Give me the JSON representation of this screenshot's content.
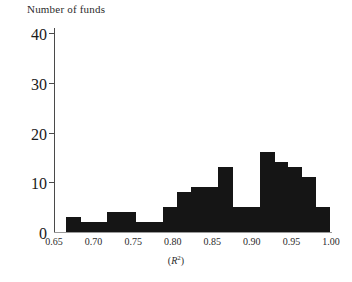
{
  "chart_data": {
    "type": "bar",
    "title": "Number of funds",
    "subtitle": "",
    "xlabel": "(R²)",
    "ylabel": "Number of funds",
    "orientation": "vertical",
    "grid": false,
    "legend": false,
    "legend_position": "none",
    "bar_color": "#151515",
    "axis_color": "#4a4a4a",
    "xlim": [
      0.64,
      1.005
    ],
    "ylim": [
      0,
      42
    ],
    "ytick_values": [
      0,
      10,
      20,
      30,
      40
    ],
    "ytick_labels": [
      "0",
      "10",
      "20",
      "30",
      "40"
    ],
    "xtick_values": [
      0.65,
      0.7,
      0.75,
      0.8,
      0.85,
      0.9,
      0.95,
      1.0
    ],
    "xtick_labels": [
      "0.65",
      "0.70",
      "0.75",
      "0.80",
      "0.85",
      "0.90",
      "0.95",
      "1.00"
    ],
    "bin_width": 0.0175,
    "bin_edges": [
      0.6475,
      0.665,
      0.6825,
      0.7,
      0.7175,
      0.735,
      0.7525,
      0.77,
      0.7875,
      0.805,
      0.8225,
      0.84,
      0.8575,
      0.875,
      0.8925,
      0.91,
      0.9275,
      0.945,
      0.9625,
      0.98,
      0.9975
    ],
    "categories": [
      "0.648-0.665",
      "0.665-0.683",
      "0.683-0.700",
      "0.700-0.718",
      "0.718-0.735",
      "0.735-0.753",
      "0.753-0.770",
      "0.770-0.788",
      "0.788-0.805",
      "0.805-0.823",
      "0.823-0.840",
      "0.840-0.858",
      "0.858-0.875",
      "0.875-0.893",
      "0.893-0.910",
      "0.910-0.928",
      "0.928-0.945",
      "0.945-0.963",
      "0.963-0.980",
      "0.980-0.998"
    ],
    "values": [
      0,
      3,
      2,
      2,
      4,
      4,
      2,
      2,
      5,
      8,
      9,
      9,
      13,
      5,
      5,
      16,
      14,
      13,
      11,
      5
    ],
    "bars": [
      {
        "x0": 0.665,
        "x1": 0.6825,
        "value": 3
      },
      {
        "x0": 0.6825,
        "x1": 0.7,
        "value": 2
      },
      {
        "x0": 0.7,
        "x1": 0.7175,
        "value": 2
      },
      {
        "x0": 0.7175,
        "x1": 0.735,
        "value": 4
      },
      {
        "x0": 0.735,
        "x1": 0.7525,
        "value": 4
      },
      {
        "x0": 0.7525,
        "x1": 0.77,
        "value": 2
      },
      {
        "x0": 0.77,
        "x1": 0.7875,
        "value": 2
      },
      {
        "x0": 0.7875,
        "x1": 0.805,
        "value": 5
      },
      {
        "x0": 0.805,
        "x1": 0.8225,
        "value": 8
      },
      {
        "x0": 0.8225,
        "x1": 0.84,
        "value": 9
      },
      {
        "x0": 0.84,
        "x1": 0.8575,
        "value": 9
      },
      {
        "x0": 0.8575,
        "x1": 0.875,
        "value": 13
      },
      {
        "x0": 0.875,
        "x1": 0.8925,
        "value": 5
      },
      {
        "x0": 0.8925,
        "x1": 0.91,
        "value": 5
      },
      {
        "x0": 0.91,
        "x1": 0.9275,
        "value": 16
      },
      {
        "x0": 0.9275,
        "x1": 0.945,
        "value": 14
      },
      {
        "x0": 0.945,
        "x1": 0.9625,
        "value": 13
      },
      {
        "x0": 0.9625,
        "x1": 0.98,
        "value": 11
      },
      {
        "x0": 0.98,
        "x1": 0.9975,
        "value": 5
      }
    ]
  }
}
